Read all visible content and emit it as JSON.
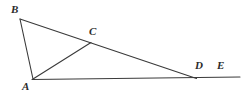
{
  "figure": {
    "kind": "geometry-diagram",
    "background_color": "#ffffff",
    "stroke_color": "#3a3a3a",
    "label_color": "#2b2b2b",
    "points": [
      {
        "name": "B",
        "label": "B",
        "x": 20,
        "y": 19
      },
      {
        "name": "C",
        "label": "C",
        "x": 91,
        "y": 42
      },
      {
        "name": "A",
        "label": "A",
        "x": 33,
        "y": 79
      },
      {
        "name": "D",
        "label": "D",
        "x": 196,
        "y": 78
      },
      {
        "name": "E",
        "label": "E",
        "x": 231,
        "y": 77
      }
    ],
    "segments": [
      {
        "name": "AB",
        "from": "A",
        "to": "B"
      },
      {
        "name": "BD",
        "from": "B",
        "to": "D"
      },
      {
        "name": "AC",
        "from": "A",
        "to": "C"
      },
      {
        "name": "AE",
        "from": "A",
        "to": "E"
      }
    ],
    "labels": {
      "B": "B",
      "C": "C",
      "A": "A",
      "D": "D",
      "E": "E"
    }
  }
}
